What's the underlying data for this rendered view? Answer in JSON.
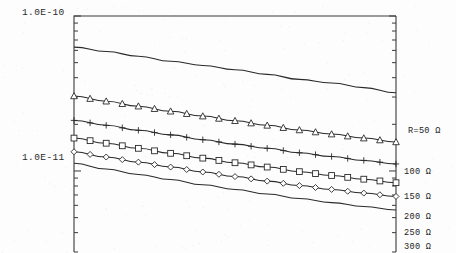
{
  "chart_data": {
    "type": "line",
    "title": "",
    "xlabel": "",
    "ylabel": "",
    "yscale": "log",
    "ylim": [
      3e-12,
      1e-10
    ],
    "xlim": [
      0,
      1
    ],
    "grid": false,
    "legend_position": "right-of-axis-inline",
    "y_tick_labels": [
      "1.0E-10",
      "1.0E-11"
    ],
    "y_tick_values": [
      1e-10,
      1e-11
    ],
    "series": [
      {
        "name": "R = 50 Ω",
        "label": "R=50 Ω",
        "marker": "none",
        "values": [
          6.3e-11,
          5.9e-11,
          5.5e-11,
          5.1e-11,
          4.8e-11,
          4.5e-11,
          4.2e-11,
          3.9e-11,
          3.7e-11,
          3.45e-11,
          3.2e-11
        ]
      },
      {
        "name": "R = 100 Ω",
        "label": "100 Ω",
        "marker": "triangle",
        "values": [
          3.05e-11,
          2.82e-11,
          2.62e-11,
          2.43e-11,
          2.26e-11,
          2.11e-11,
          1.97e-11,
          1.84e-11,
          1.73e-11,
          1.63e-11,
          1.54e-11
        ]
      },
      {
        "name": "R = 150 Ω",
        "label": "150 Ω",
        "marker": "plus",
        "values": [
          2.12e-11,
          1.97e-11,
          1.83e-11,
          1.71e-11,
          1.59e-11,
          1.49e-11,
          1.4e-11,
          1.31e-11,
          1.24e-11,
          1.17e-11,
          1.11e-11
        ]
      },
      {
        "name": "R = 200 Ω",
        "label": "200 Ω",
        "marker": "square",
        "values": [
          1.63e-11,
          1.51e-11,
          1.4e-11,
          1.3e-11,
          1.21e-11,
          1.13e-11,
          1.06e-11,
          9.9e-12,
          9.35e-12,
          8.85e-12,
          8.4e-12
        ]
      },
      {
        "name": "R = 250 Ω",
        "label": "250 Ω",
        "marker": "diamond",
        "values": [
          1.33e-11,
          1.23e-11,
          1.14e-11,
          1.06e-11,
          9.85e-12,
          9.2e-12,
          8.6e-12,
          8.05e-12,
          7.6e-12,
          7.2e-12,
          6.85e-12
        ]
      },
      {
        "name": "R = 300 Ω",
        "label": "300 Ω",
        "marker": "none",
        "values": [
          1.12e-11,
          1.03e-11,
          9.5e-12,
          8.8e-12,
          8.15e-12,
          7.6e-12,
          7.1e-12,
          6.65e-12,
          6.25e-12,
          5.9e-12,
          5.6e-12
        ]
      }
    ]
  },
  "axes": {
    "y_top_label": "1.0E-10",
    "y_mid_label": "1.0E-11"
  },
  "annotations": {
    "r50": "R=50 Ω",
    "r100": "100 Ω",
    "r150": "150 Ω",
    "r200": "200 Ω",
    "r250": "250 Ω",
    "r300": "300 Ω"
  }
}
